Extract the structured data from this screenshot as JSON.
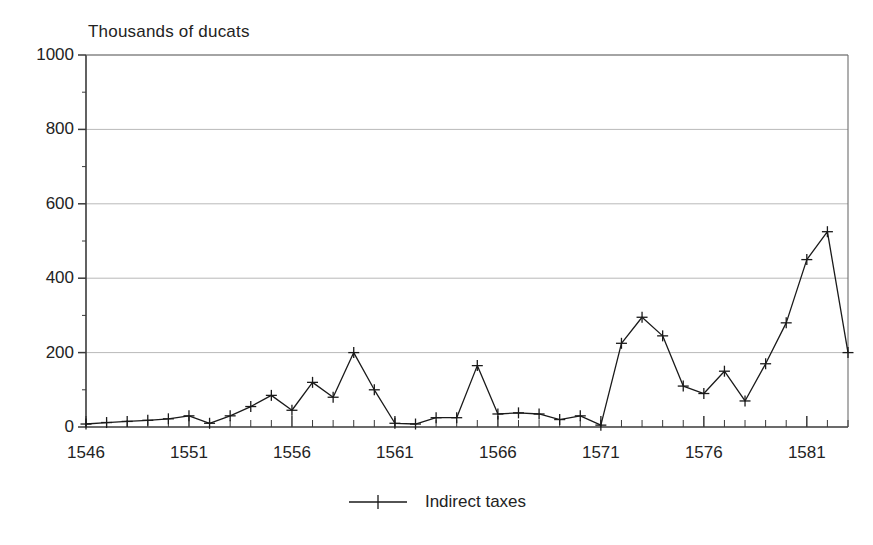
{
  "chart_data": {
    "type": "line",
    "title": "",
    "ylabel": "Thousands of ducats",
    "xlabel": "",
    "ylim": [
      0,
      1000
    ],
    "xlim": [
      1546,
      1583
    ],
    "grid": true,
    "grid_axis": "y",
    "legend_position": "bottom-center",
    "y_ticks": [
      0,
      200,
      400,
      600,
      800,
      1000
    ],
    "y_minor_tick_step": 100,
    "x_ticks_labeled": [
      1546,
      1551,
      1556,
      1561,
      1566,
      1571,
      1576,
      1581
    ],
    "x_minor_tick_step": 1,
    "marker": "plus",
    "series": [
      {
        "name": "Indirect taxes",
        "color": "#1a1a1a",
        "x": [
          1546,
          1547,
          1548,
          1549,
          1550,
          1551,
          1552,
          1553,
          1554,
          1555,
          1556,
          1557,
          1558,
          1559,
          1560,
          1561,
          1562,
          1563,
          1564,
          1565,
          1566,
          1567,
          1568,
          1569,
          1570,
          1571,
          1572,
          1573,
          1574,
          1575,
          1576,
          1577,
          1578,
          1579,
          1580,
          1581,
          1582,
          1583
        ],
        "values": [
          8,
          12,
          15,
          18,
          22,
          30,
          10,
          30,
          55,
          85,
          45,
          120,
          80,
          200,
          100,
          10,
          8,
          25,
          25,
          165,
          35,
          38,
          35,
          20,
          30,
          5,
          225,
          295,
          245,
          110,
          90,
          150,
          70,
          170,
          280,
          450,
          525,
          200
        ]
      }
    ]
  },
  "legend": {
    "entries": [
      {
        "label": "Indirect taxes",
        "marker": "plus-marker"
      }
    ]
  }
}
